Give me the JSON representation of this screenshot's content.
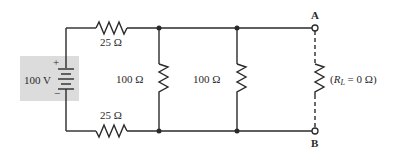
{
  "diagram": {
    "type": "circuit-schematic",
    "source": {
      "label": "100 V",
      "plus_sign": "+",
      "minus_sign": "−",
      "highlight_color": "#dcdcdc"
    },
    "resistors": {
      "top_series": {
        "label": "25 Ω"
      },
      "bottom_series": {
        "label": "25 Ω"
      },
      "shunt_1": {
        "label": "100 Ω"
      },
      "shunt_2": {
        "label": "100 Ω"
      },
      "load": {
        "label_prefix": "(",
        "label_r": "R",
        "label_sub": "L",
        "label_suffix": " = 0 Ω)"
      }
    },
    "terminals": {
      "a": {
        "label": "A"
      },
      "b": {
        "label": "B"
      }
    },
    "colors": {
      "line": "#2a2a2a",
      "background": "#ffffff"
    }
  }
}
